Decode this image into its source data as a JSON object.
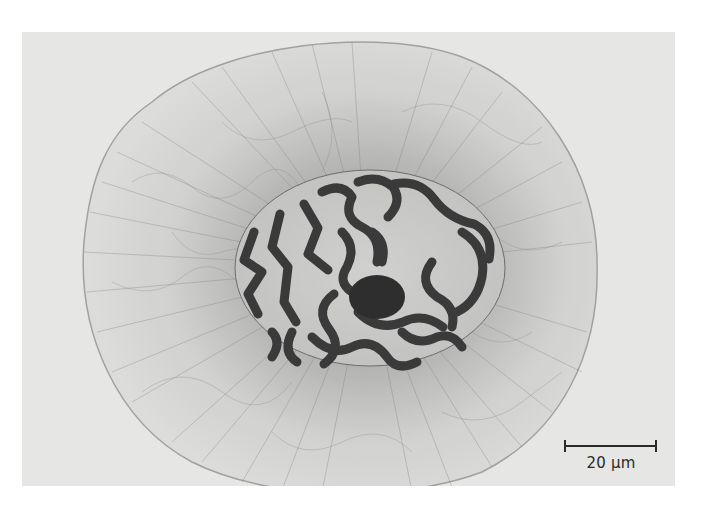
{
  "image": {
    "description": "Light micrograph of a cell in prophase showing condensed chromosomes within the nucleus surrounded by radiating cytoplasmic fibers",
    "background_color": "#e6e6e4",
    "cell_outline_color": "#9a9a98",
    "chromosome_color": "#3a3a3a"
  },
  "scale_bar": {
    "label": "20 µm",
    "length_px": 92
  }
}
